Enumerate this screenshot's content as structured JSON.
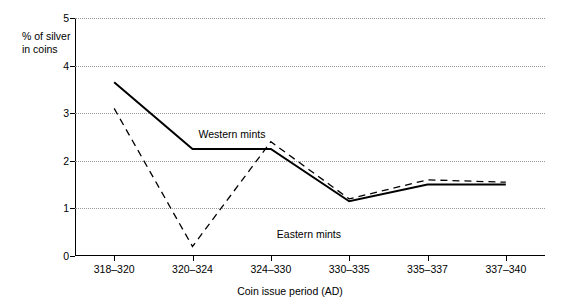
{
  "chart_data": {
    "type": "line",
    "title": "",
    "xlabel": "Coin issue period  (AD)",
    "ylabel": "% of silver\nin coins",
    "categories": [
      "318–320",
      "320–324",
      "324–330",
      "330–335",
      "335–337",
      "337–340"
    ],
    "yticks": [
      "0",
      "1",
      "2",
      "3",
      "4",
      "5"
    ],
    "ylim": [
      0,
      5
    ],
    "grid": "horizontal-dotted",
    "legend": "inline-labels",
    "series": [
      {
        "name": "Western mints",
        "style": "solid",
        "color": "#000000",
        "values": [
          3.65,
          2.25,
          2.25,
          1.15,
          1.5,
          1.5
        ]
      },
      {
        "name": "Eastern mints",
        "style": "dashed",
        "color": "#000000",
        "values": [
          3.1,
          0.2,
          2.4,
          1.2,
          1.6,
          1.55
        ]
      }
    ],
    "annotations": [
      {
        "text": "Western mints",
        "x_category": "320–324",
        "y_value": 2.55
      },
      {
        "text": "Eastern mints",
        "x_category": "324–330",
        "y_value": 0.45
      }
    ]
  }
}
